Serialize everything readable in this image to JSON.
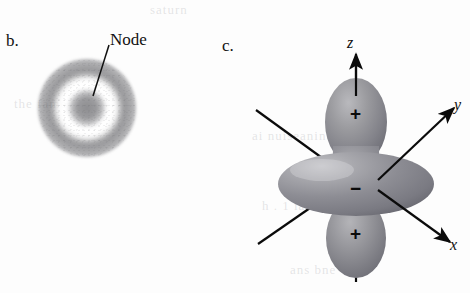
{
  "figure": {
    "background_color": "#fdfdfd",
    "ink_color": "#111111",
    "orbital_fill_color": "#7e7e82"
  },
  "panel_b": {
    "label": "b.",
    "annotation": {
      "text": "Node",
      "leader_line": true
    },
    "diagram_name": "2s-orbital-electron-density-cloud",
    "description_parts": [
      "outer-diffuse-shell",
      "white-node-ring",
      "inner-dense-core"
    ]
  },
  "panel_c": {
    "label": "c.",
    "diagram_name": "dz2-orbital",
    "axes": [
      {
        "name": "z",
        "label": "z",
        "direction": "up"
      },
      {
        "name": "y",
        "label": "y",
        "direction": "upper-right"
      },
      {
        "name": "x",
        "label": "x",
        "direction": "lower-right"
      }
    ],
    "lobe_signs": [
      {
        "position": "top-lobe",
        "label": "+"
      },
      {
        "position": "torus-ring",
        "label": "−"
      },
      {
        "position": "bottom-lobe",
        "label": "+"
      }
    ]
  },
  "ghost_text": [
    {
      "text": "saturn",
      "left": 150,
      "top": 2
    },
    {
      "text": "the fame",
      "left": 14,
      "top": 96
    },
    {
      "text": "ai nuiseanin",
      "left": 252,
      "top": 128
    },
    {
      "text": "h . 1 ia",
      "left": 262,
      "top": 198
    },
    {
      "text": "ans bne",
      "left": 290,
      "top": 262
    }
  ]
}
